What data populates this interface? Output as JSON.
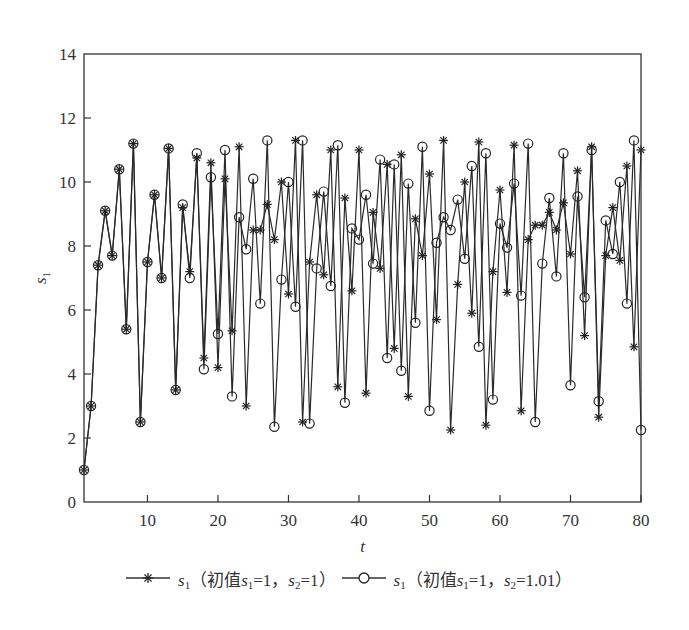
{
  "chart_data": {
    "type": "line",
    "title": "",
    "xlabel": "t",
    "ylabel": "s1",
    "xlim": [
      1,
      80
    ],
    "ylim": [
      0,
      14
    ],
    "xticks": [
      10,
      20,
      30,
      40,
      50,
      60,
      70,
      80
    ],
    "yticks": [
      0,
      2,
      4,
      6,
      8,
      10,
      12,
      14
    ],
    "grid": false,
    "legend_position": "bottom",
    "x": [
      1,
      2,
      3,
      4,
      5,
      6,
      7,
      8,
      9,
      10,
      11,
      12,
      13,
      14,
      15,
      16,
      17,
      18,
      19,
      20,
      21,
      22,
      23,
      24,
      25,
      26,
      27,
      28,
      29,
      30,
      31,
      32,
      33,
      34,
      35,
      36,
      37,
      38,
      39,
      40,
      41,
      42,
      43,
      44,
      45,
      46,
      47,
      48,
      49,
      50,
      51,
      52,
      53,
      54,
      55,
      56,
      57,
      58,
      59,
      60,
      61,
      62,
      63,
      64,
      65,
      66,
      67,
      68,
      69,
      70,
      71,
      72,
      73,
      74,
      75,
      76,
      77,
      78,
      79,
      80
    ],
    "series": [
      {
        "name": "s1（初值s1=1，s2=1）",
        "marker": "star",
        "values": [
          1.0,
          3.0,
          7.4,
          9.1,
          7.7,
          10.4,
          5.4,
          11.2,
          2.5,
          7.5,
          9.6,
          7.0,
          11.05,
          3.5,
          9.2,
          7.2,
          10.75,
          4.5,
          10.6,
          4.2,
          10.1,
          5.35,
          11.1,
          3.0,
          8.5,
          8.5,
          9.3,
          8.2,
          10.0,
          6.5,
          11.3,
          2.5,
          7.5,
          9.6,
          7.1,
          11.0,
          3.6,
          9.5,
          6.6,
          11.0,
          3.4,
          9.05,
          7.3,
          10.55,
          4.8,
          10.85,
          3.3,
          8.85,
          7.7,
          10.25,
          5.7,
          11.3,
          2.25,
          6.8,
          10.0,
          5.9,
          11.25,
          2.4,
          7.2,
          9.75,
          6.55,
          11.15,
          2.85,
          8.2,
          8.65,
          8.65,
          9.05,
          8.5,
          9.35,
          7.75,
          10.35,
          5.2,
          11.1,
          2.65,
          7.7,
          9.2,
          7.55,
          10.5,
          4.85,
          11.0
        ]
      },
      {
        "name": "s1（初值s1=1，s2=1.01）",
        "marker": "circle",
        "values": [
          1.0,
          3.0,
          7.4,
          9.1,
          7.7,
          10.4,
          5.4,
          11.2,
          2.5,
          7.5,
          9.6,
          7.0,
          11.05,
          3.5,
          9.3,
          7.0,
          10.9,
          4.15,
          10.15,
          5.25,
          11.0,
          3.3,
          8.9,
          7.9,
          10.1,
          6.2,
          11.3,
          2.35,
          6.95,
          10.0,
          6.1,
          11.3,
          2.45,
          7.3,
          9.7,
          6.75,
          11.15,
          3.1,
          8.55,
          8.2,
          9.6,
          7.45,
          10.7,
          4.5,
          10.55,
          4.1,
          9.95,
          5.6,
          11.1,
          2.85,
          8.1,
          8.9,
          8.5,
          9.45,
          7.6,
          10.5,
          4.85,
          10.9,
          3.2,
          8.7,
          7.95,
          9.95,
          6.45,
          11.2,
          2.5,
          7.45,
          9.5,
          7.05,
          10.9,
          3.65,
          9.55,
          6.4,
          11.0,
          3.15,
          8.8,
          7.75,
          10.0,
          6.2,
          11.3,
          2.25
        ]
      }
    ]
  },
  "legend": {
    "items": [
      {
        "symbol": "s",
        "sub": "1",
        "text_pre": "（初值",
        "var1": "s",
        "sub1": "1",
        "eq1": "=1，",
        "var2": "s",
        "sub2": "2",
        "eq2": "=1）"
      },
      {
        "symbol": "s",
        "sub": "1",
        "text_pre": "（初值",
        "var1": "s",
        "sub1": "1",
        "eq1": "=1，",
        "var2": "s",
        "sub2": "2",
        "eq2": "=1.01）"
      }
    ]
  },
  "colors": {
    "line": "#2a2a2a",
    "axis": "#333333",
    "background": "#ffffff"
  }
}
